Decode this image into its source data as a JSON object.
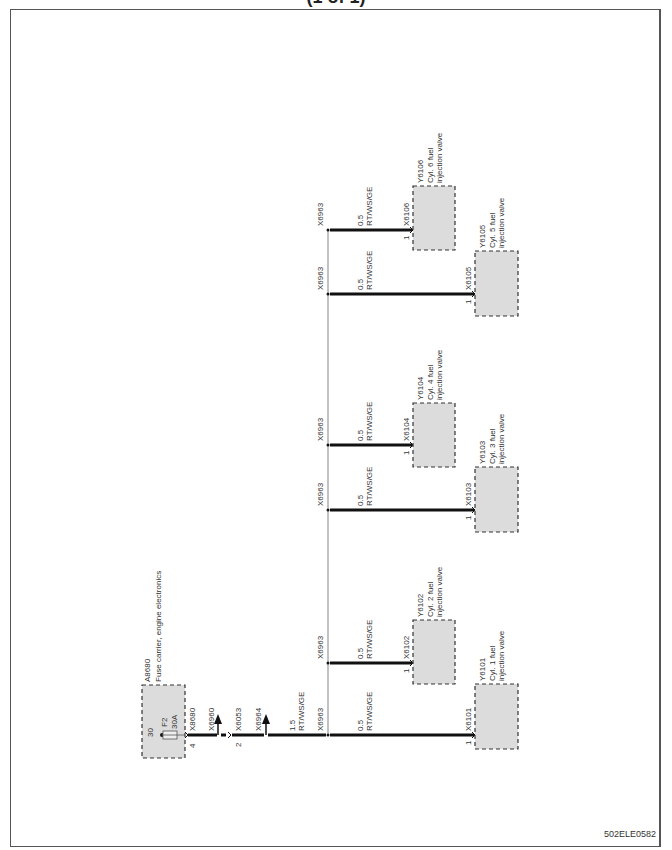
{
  "page": {
    "title": "(1 of 1)",
    "doc_id": "502ELE0582"
  },
  "fuse_carrier": {
    "id": "A8680",
    "label": "Fuse carrier,  engine electronics",
    "terminal": "30",
    "fuse": "F2",
    "rating": "30A",
    "pin": "4",
    "connector": "X8680"
  },
  "feed_wire": {
    "connectors": [
      {
        "id": "X6960",
        "type": "arrow-up"
      },
      {
        "id": "X6053",
        "pin": "2",
        "type": "plug"
      },
      {
        "id": "X6964",
        "type": "arrow-up"
      }
    ],
    "gauge": "1.5",
    "color": "RT/WS/GE",
    "splice": "X6963"
  },
  "branches": [
    {
      "splice": "X6963",
      "gauge": "0.5",
      "color": "RT/WS/GE",
      "connector": "X6106",
      "pin": "1",
      "component": "Y6106",
      "desc1": "Cyl.  6 fuel",
      "desc2": "injection valve"
    },
    {
      "splice": "X6963",
      "gauge": "0.5",
      "color": "RT/WS/GE",
      "connector": "X6105",
      "pin": "1",
      "component": "Y6105",
      "desc1": "Cyl.  5 fuel",
      "desc2": "injection valve"
    },
    {
      "splice": "X6963",
      "gauge": "0.5",
      "color": "RT/WS/GE",
      "connector": "X6104",
      "pin": "1",
      "component": "Y6104",
      "desc1": "Cyl.  4 fuel",
      "desc2": "injection valve"
    },
    {
      "splice": "X6963",
      "gauge": "0.5",
      "color": "RT/WS/GE",
      "connector": "X6103",
      "pin": "1",
      "component": "Y6103",
      "desc1": "Cyl.  3 fuel",
      "desc2": "injection valve"
    },
    {
      "splice": "X6963",
      "gauge": "0.5",
      "color": "RT/WS/GE",
      "connector": "X6102",
      "pin": "1",
      "component": "Y6102",
      "desc1": "Cyl.  2 fuel",
      "desc2": "injection valve"
    },
    {
      "splice": "X6963",
      "gauge": "0.5",
      "color": "RT/WS/GE",
      "connector": "X6101",
      "pin": "1",
      "component": "Y6101",
      "desc1": "Cyl.  1 fuel",
      "desc2": "injection valve"
    }
  ],
  "colors": {
    "wire": "#111111",
    "bus": "#999999",
    "component_fill": "#dcdcdc",
    "frame": "#555555"
  }
}
